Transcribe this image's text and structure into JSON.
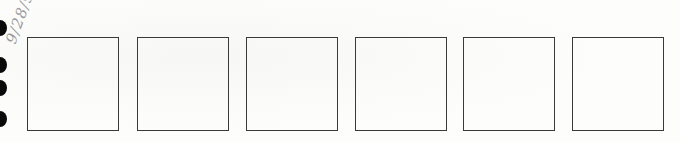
{
  "page": {
    "handwritten_note": "9/28/95",
    "box_count": 6,
    "boxes": [
      {
        "id": 1,
        "left": 27
      },
      {
        "id": 2,
        "left": 137
      },
      {
        "id": 3,
        "left": 246
      },
      {
        "id": 4,
        "left": 355
      },
      {
        "id": 5,
        "left": 463
      },
      {
        "id": 6,
        "left": 572
      }
    ],
    "binder_holes": [
      {
        "top": 20
      },
      {
        "top": 57
      },
      {
        "top": 80
      },
      {
        "top": 111
      }
    ],
    "colors": {
      "box_border": "#3a3a3a",
      "hole": "#0a0a0a",
      "handwriting": "#9a9a9a",
      "paper": "#fdfdfc"
    }
  }
}
